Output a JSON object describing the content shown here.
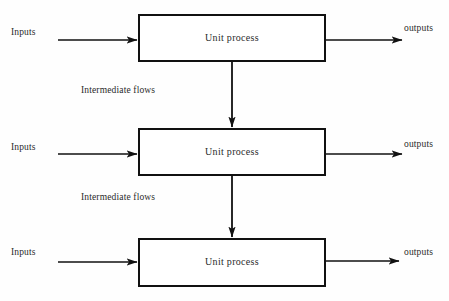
{
  "diagram": {
    "type": "flow-diagram",
    "canvas": {
      "width": 449,
      "height": 301,
      "background": "#fefefe"
    },
    "stroke_color": "#111111",
    "text_color": "#2a2a2a",
    "stages": [
      {
        "id": "stage-1",
        "title": "Unit process",
        "input_label": "Inputs",
        "output_label": "outputs",
        "box": {
          "x": 138,
          "y": 14,
          "width": 188,
          "height": 48
        }
      },
      {
        "id": "stage-2",
        "title": "Unit process",
        "input_label": "Inputs",
        "output_label": "outputs",
        "box": {
          "x": 138,
          "y": 128,
          "width": 188,
          "height": 48
        }
      },
      {
        "id": "stage-3",
        "title": "Unit process",
        "input_label": "Inputs",
        "output_label": "outputs",
        "box": {
          "x": 138,
          "y": 238,
          "width": 188,
          "height": 49
        }
      }
    ],
    "intermediate_flows": [
      {
        "id": "intermediate-flow-1",
        "label": "Intermediate flows",
        "from": "stage-1",
        "to": "stage-2"
      },
      {
        "id": "intermediate-flow-2",
        "label": "Intermediate flows",
        "from": "stage-2",
        "to": "stage-3"
      }
    ]
  }
}
